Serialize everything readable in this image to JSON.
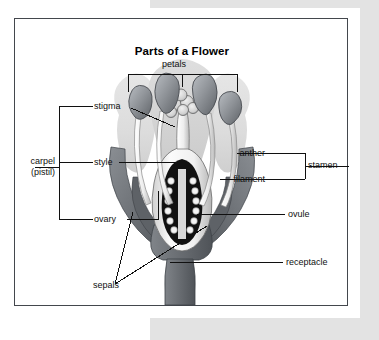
{
  "figure": {
    "title": "Parts of a Flower",
    "type": "labeled-anatomical-diagram"
  },
  "labels": {
    "petals": "petals",
    "stigma": "stigma",
    "style": "style",
    "ovary": "ovary",
    "carpel_line1": "carpel",
    "carpel_line2": "(pistil)",
    "anther": "anther",
    "filament": "filament",
    "stamen": "stamen",
    "ovule": "ovule",
    "receptacle": "receptacle",
    "sepals": "sepals"
  },
  "groups": [
    {
      "name": "carpel",
      "label": "carpel (pistil)",
      "members": [
        "stigma",
        "style",
        "ovary"
      ],
      "side": "left"
    },
    {
      "name": "stamen",
      "label": "stamen",
      "members": [
        "anther",
        "filament"
      ],
      "side": "right"
    },
    {
      "name": "petals",
      "label": "petals",
      "members": [
        "petal-left",
        "petal-center",
        "petal-right"
      ],
      "side": "top"
    }
  ],
  "colors": {
    "frame": "#43474d",
    "leader": "#101010",
    "text": "#101010",
    "page_backdrop": "#e3e3e3",
    "paper": "#ffffff",
    "petal_fill": "#e0e0e0",
    "petal_fill_dark": "#d2d2d2",
    "sepal_fill": "#6f7378",
    "sepal_fill_dark": "#5a5e63",
    "stem_fill": "#6a6e73",
    "anther_fill": "#8d9196",
    "filament_fill": "#f2f2f2",
    "ovary_fill": "#111111",
    "ovule_fill": "#f4f4f4",
    "stigma_fill": "#dcdcdc"
  }
}
